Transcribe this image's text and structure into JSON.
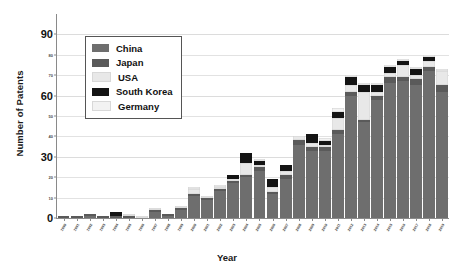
{
  "chart_data": {
    "type": "bar",
    "title": "",
    "xlabel": "Year",
    "ylabel": "Number of Patents",
    "ylim": [
      0,
      100
    ],
    "grid": true,
    "stacked": true,
    "legend_position": "upper-left-inside",
    "y_major_ticks": [
      0,
      30,
      60,
      90
    ],
    "y_minor_ticks": [
      10,
      20,
      40,
      50,
      70,
      80
    ],
    "categories": [
      "1990",
      "1991",
      "1992",
      "1993",
      "1994",
      "1995",
      "1996",
      "1997",
      "1998",
      "1999",
      "2000",
      "2001",
      "2002",
      "2003",
      "2004",
      "2005",
      "2006",
      "2007",
      "2008",
      "2009",
      "2010",
      "2011",
      "2012",
      "2013",
      "2014",
      "2015",
      "2016",
      "2017",
      "2018",
      "2019"
    ],
    "series": [
      {
        "name": "China",
        "color": "#6e6e6e",
        "values": [
          0,
          0,
          1,
          0,
          0,
          0,
          0,
          3,
          1,
          4,
          11,
          9,
          13,
          17,
          20,
          23,
          12,
          19,
          36,
          33,
          33,
          41,
          60,
          47,
          58,
          66,
          67,
          65,
          72,
          62
        ]
      },
      {
        "name": "Japan",
        "color": "#5a5a5a",
        "values": [
          1,
          1,
          1,
          1,
          1,
          1,
          0,
          1,
          1,
          1,
          1,
          1,
          1,
          1,
          1,
          2,
          1,
          2,
          2,
          2,
          2,
          2,
          2,
          1,
          2,
          3,
          2,
          3,
          2,
          3
        ]
      },
      {
        "name": "USA",
        "color": "#e8e8e8",
        "values": [
          0,
          0,
          0,
          0,
          0,
          1,
          1,
          1,
          0,
          1,
          2,
          1,
          1,
          1,
          6,
          1,
          2,
          2,
          2,
          2,
          1,
          6,
          3,
          14,
          2,
          2,
          6,
          2,
          3,
          7
        ]
      },
      {
        "name": "South Korea",
        "color": "#141414",
        "values": [
          0,
          0,
          0,
          0,
          2,
          0,
          0,
          0,
          0,
          0,
          0,
          0,
          0,
          2,
          5,
          2,
          4,
          3,
          0,
          4,
          2,
          3,
          4,
          3,
          3,
          3,
          2,
          3,
          2,
          0
        ]
      },
      {
        "name": "Germany",
        "color": "#f2f2f2",
        "values": [
          0,
          0,
          0,
          0,
          0,
          0,
          0,
          0,
          0,
          0,
          1,
          0,
          1,
          0,
          0,
          1,
          0,
          0,
          0,
          0,
          1,
          2,
          1,
          1,
          1,
          1,
          1,
          1,
          1,
          1
        ]
      }
    ]
  },
  "legend": {
    "items": [
      {
        "label": "China"
      },
      {
        "label": "Japan"
      },
      {
        "label": "USA"
      },
      {
        "label": "South Korea"
      },
      {
        "label": "Germany"
      }
    ]
  }
}
